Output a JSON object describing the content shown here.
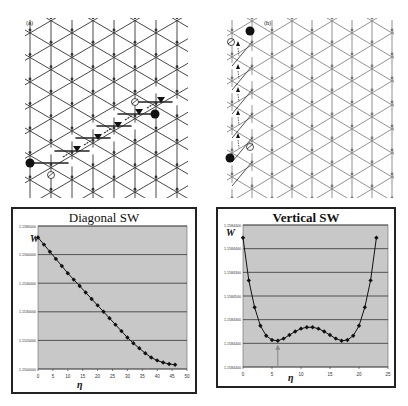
{
  "figure": {
    "panel_a": {
      "label": "(a)"
    },
    "panel_b": {
      "label": "(b)"
    }
  },
  "chart_data": [
    {
      "type": "line",
      "title": "Diagonal SW",
      "xlabel": "η",
      "ylabel": "W",
      "x_ticks": [
        "0",
        "5",
        "10",
        "15",
        "20",
        "25",
        "30",
        "35",
        "40",
        "45",
        "50"
      ],
      "y_ticks": [
        "1.1580000",
        "1.1560000",
        "1.1540000",
        "1.1530000",
        "1.1520000",
        "1.1500000"
      ],
      "xlim": [
        0,
        50
      ],
      "ylim_normalized": [
        0,
        1
      ],
      "grid": "horizontal",
      "background": "#c8c8c8",
      "series": [
        {
          "name": "W",
          "marker": "diamond",
          "x": [
            0,
            2,
            4,
            6,
            8,
            10,
            12,
            14,
            16,
            18,
            20,
            22,
            24,
            26,
            28,
            30,
            32,
            34,
            36,
            38,
            40,
            42,
            44,
            46
          ],
          "y_normalized": [
            0.92,
            0.87,
            0.82,
            0.77,
            0.72,
            0.67,
            0.625,
            0.58,
            0.535,
            0.49,
            0.445,
            0.4,
            0.355,
            0.31,
            0.265,
            0.22,
            0.18,
            0.145,
            0.11,
            0.08,
            0.06,
            0.045,
            0.035,
            0.03
          ]
        }
      ]
    },
    {
      "type": "line",
      "title": "Vertical SW",
      "xlabel": "η",
      "ylabel": "W",
      "x_ticks": [
        "0",
        "5",
        "10",
        "15",
        "20",
        "25"
      ],
      "y_ticks": [
        "1.1584400",
        "1.1584400",
        "1.1584300",
        "1.1584500",
        "1.1584300",
        "1.1584400",
        "1.1584400"
      ],
      "xlim": [
        0,
        25
      ],
      "ylim_normalized": [
        0,
        1
      ],
      "grid": "horizontal",
      "background": "#c8c8c8",
      "annotation": "arrow pointing up at local minimum near η≈6",
      "series": [
        {
          "name": "W",
          "marker": "diamond",
          "x": [
            0,
            1,
            2,
            3,
            4,
            5,
            6,
            7,
            8,
            9,
            10,
            11,
            12,
            13,
            14,
            15,
            16,
            17,
            18,
            19,
            20,
            21,
            22,
            23
          ],
          "y_normalized": [
            0.91,
            0.61,
            0.42,
            0.29,
            0.22,
            0.19,
            0.185,
            0.2,
            0.225,
            0.25,
            0.27,
            0.28,
            0.28,
            0.27,
            0.25,
            0.225,
            0.2,
            0.185,
            0.19,
            0.22,
            0.29,
            0.42,
            0.61,
            0.91
          ]
        }
      ]
    }
  ]
}
